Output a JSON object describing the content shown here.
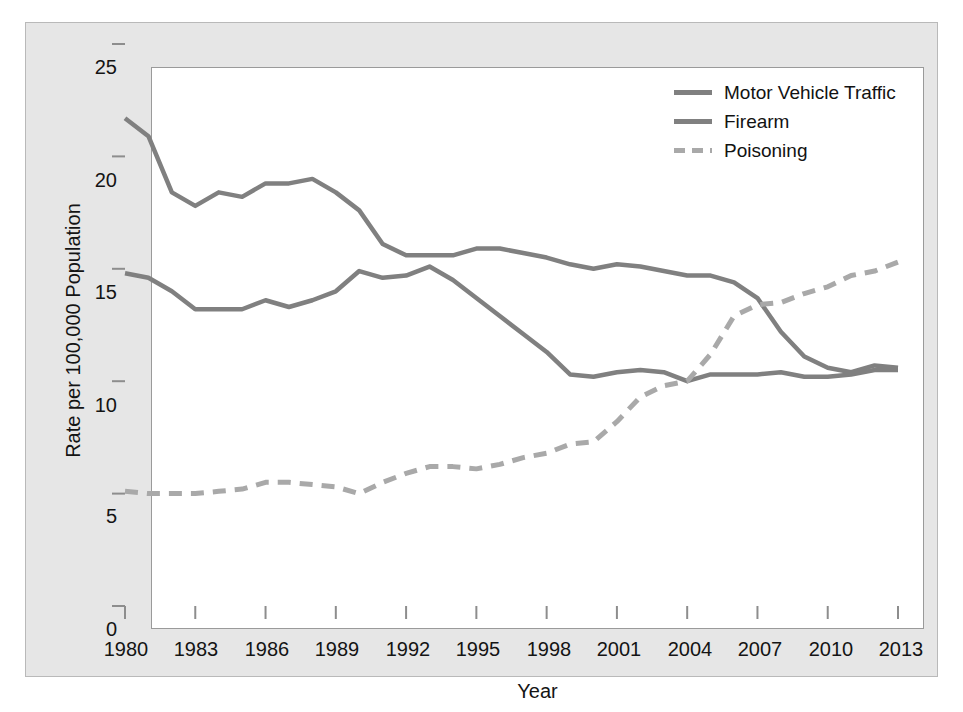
{
  "chart_data": {
    "type": "line",
    "title": "",
    "xlabel": "Year",
    "ylabel": "Rate per 100,000 Population",
    "xlim": [
      1980,
      2013
    ],
    "ylim": [
      0,
      25
    ],
    "grid": false,
    "legend_position": "top-right",
    "xticks": [
      "1980",
      "1983",
      "1986",
      "1989",
      "1992",
      "1995",
      "1998",
      "2001",
      "2004",
      "2007",
      "2010",
      "2013"
    ],
    "yticks": [
      "0",
      "5",
      "10",
      "15",
      "20",
      "25"
    ],
    "x": [
      1980,
      1981,
      1982,
      1983,
      1984,
      1985,
      1986,
      1987,
      1988,
      1989,
      1990,
      1991,
      1992,
      1993,
      1994,
      1995,
      1996,
      1997,
      1998,
      1999,
      2000,
      2001,
      2002,
      2003,
      2004,
      2005,
      2006,
      2007,
      2008,
      2009,
      2010,
      2011,
      2012,
      2013
    ],
    "series": [
      {
        "name": "Motor Vehicle Traffic",
        "style": "solid",
        "color": "#808080",
        "values": [
          21.7,
          20.9,
          18.4,
          17.8,
          18.4,
          18.2,
          18.8,
          18.8,
          19.0,
          18.4,
          17.6,
          16.1,
          15.6,
          15.6,
          15.6,
          15.9,
          15.9,
          15.7,
          15.5,
          15.2,
          15.0,
          15.2,
          15.1,
          14.9,
          14.7,
          14.7,
          14.4,
          13.7,
          12.2,
          11.1,
          10.6,
          10.4,
          10.7,
          10.6
        ]
      },
      {
        "name": "Firearm",
        "style": "solid",
        "color": "#808080",
        "values": [
          14.8,
          14.6,
          14.0,
          13.2,
          13.2,
          13.2,
          13.6,
          13.3,
          13.6,
          14.0,
          14.9,
          14.6,
          14.7,
          15.1,
          14.5,
          13.7,
          12.9,
          12.1,
          11.3,
          10.3,
          10.2,
          10.4,
          10.5,
          10.4,
          10.0,
          10.3,
          10.3,
          10.3,
          10.4,
          10.2,
          10.2,
          10.3,
          10.5,
          10.5
        ]
      },
      {
        "name": "Poisoning",
        "style": "dashed",
        "color": "#a9a9a9",
        "values": [
          5.1,
          5.0,
          5.0,
          5.0,
          5.1,
          5.2,
          5.5,
          5.5,
          5.4,
          5.3,
          5.0,
          5.5,
          5.9,
          6.2,
          6.2,
          6.1,
          6.3,
          6.6,
          6.8,
          7.2,
          7.3,
          8.2,
          9.3,
          9.8,
          10.0,
          11.2,
          12.9,
          13.4,
          13.5,
          13.9,
          14.2,
          14.7,
          14.9,
          15.3
        ]
      }
    ]
  },
  "axis": {
    "y_title": "Rate per 100,000 Population",
    "x_title": "Year"
  },
  "legend": {
    "items": [
      {
        "label": "Motor Vehicle Traffic",
        "style": "solid"
      },
      {
        "label": "Firearm",
        "style": "solid"
      },
      {
        "label": "Poisoning",
        "style": "dashed"
      }
    ]
  },
  "caption": {
    "text": ""
  }
}
